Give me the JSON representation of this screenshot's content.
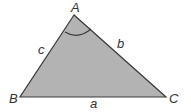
{
  "diagram": {
    "type": "triangle",
    "fill_color": "#b3b3b3",
    "stroke_color": "#3a3a3a",
    "vertices": {
      "A": {
        "label": "A"
      },
      "B": {
        "label": "B"
      },
      "C": {
        "label": "C"
      }
    },
    "sides": {
      "a": {
        "label": "a"
      },
      "b": {
        "label": "b"
      },
      "c": {
        "label": "c"
      }
    },
    "angle_marker": "angle-A-arc"
  }
}
